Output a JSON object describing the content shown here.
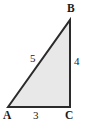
{
  "figure": {
    "kind": "right-triangle",
    "background_color": "#ffffff",
    "fill_color": "#e8e8e8",
    "stroke_color": "#2b2b2b",
    "stroke_width": 2,
    "width": 87,
    "height": 126,
    "vertices": [
      {
        "name": "A",
        "label": "A",
        "x": 8,
        "y": 107,
        "role": "bottom-left"
      },
      {
        "name": "B",
        "label": "B",
        "x": 70,
        "y": 20,
        "role": "top-right"
      },
      {
        "name": "C",
        "label": "C",
        "x": 70,
        "y": 107,
        "role": "bottom-right-right-angle"
      }
    ],
    "sides": [
      {
        "name": "hypotenuse-AB",
        "label": "5",
        "from": "A",
        "to": "B",
        "length": 5
      },
      {
        "name": "leg-BC",
        "label": "4",
        "from": "B",
        "to": "C",
        "length": 4
      },
      {
        "name": "leg-AC",
        "label": "3",
        "from": "A",
        "to": "C",
        "length": 3
      }
    ]
  },
  "chart_data": {
    "type": "diagram",
    "title": "",
    "categories": [
      "AB (hypotenuse)",
      "BC (vertical leg)",
      "AC (horizontal leg)"
    ],
    "values": [
      5,
      4,
      3
    ],
    "annotations": [
      "A",
      "B",
      "C",
      "5",
      "4",
      "3"
    ]
  }
}
